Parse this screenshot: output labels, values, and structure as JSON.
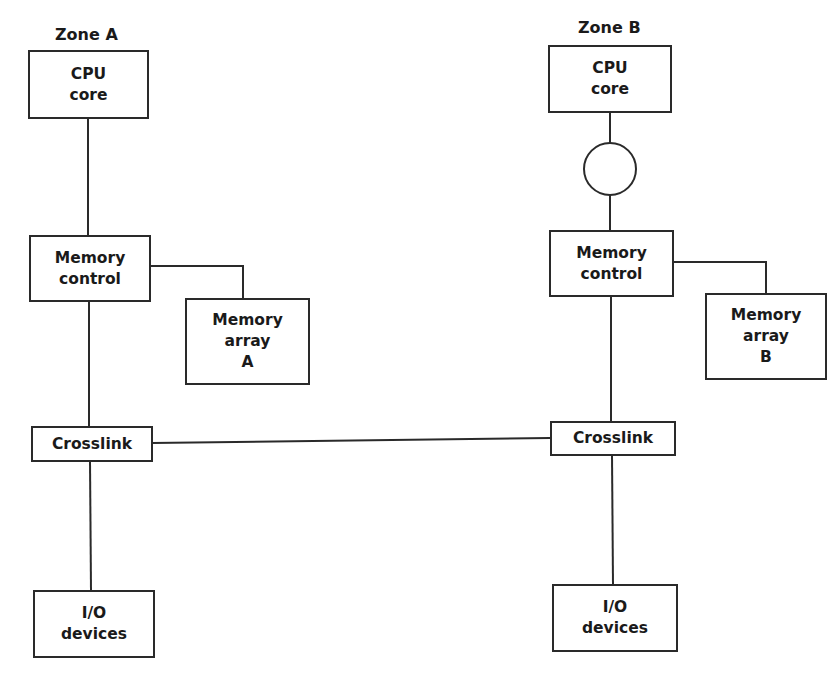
{
  "zones": [
    {
      "label": "Zone A",
      "cpu": [
        "CPU",
        "core"
      ],
      "memory_control": [
        "Memory",
        "control"
      ],
      "memory_array": [
        "Memory",
        "array",
        "A"
      ],
      "crosslink": "Crosslink",
      "io": [
        "I/O",
        "devices"
      ],
      "has_circle": false
    },
    {
      "label": "Zone B",
      "cpu": [
        "CPU",
        "core"
      ],
      "memory_control": [
        "Memory",
        "control"
      ],
      "memory_array": [
        "Memory",
        "array",
        "B"
      ],
      "crosslink": "Crosslink",
      "io": [
        "I/O",
        "devices"
      ],
      "has_circle": true
    }
  ],
  "colors": {
    "line": "#2a2a2a",
    "background": "#ffffff"
  }
}
